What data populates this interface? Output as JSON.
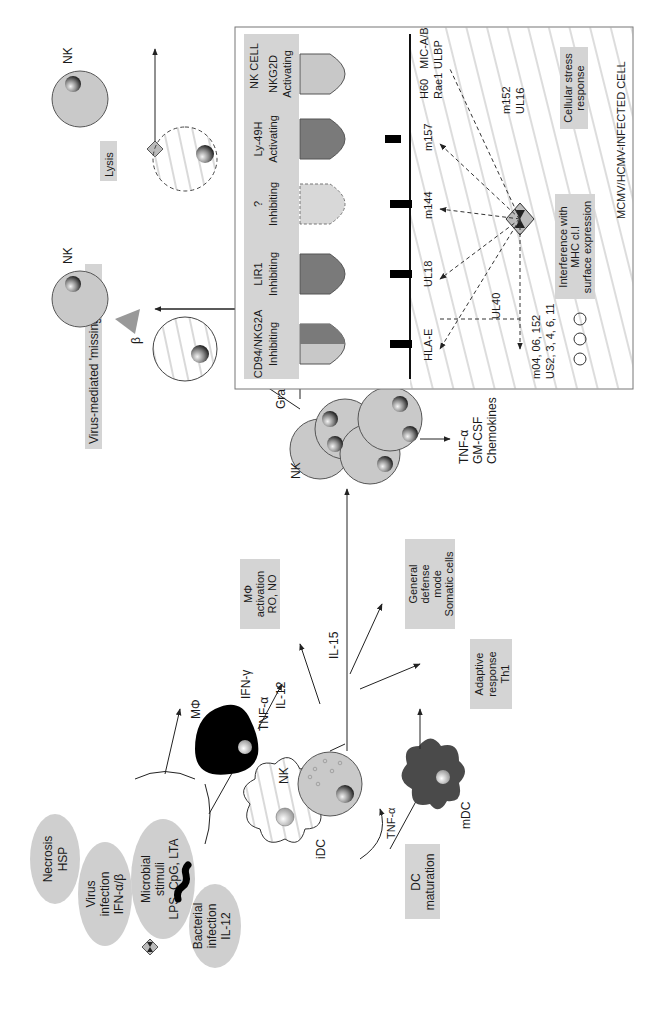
{
  "stimuli": {
    "necrosis": [
      "Necrosis",
      "HSP"
    ],
    "virus": [
      "Virus",
      "infection",
      "IFN-α/β"
    ],
    "microbial": [
      "Microbial",
      "stimuli",
      "LPS, CpG, LTA"
    ],
    "bacterial": [
      "Bacterial",
      "infection",
      "IL-12"
    ]
  },
  "cells": {
    "macrophage": "MΦ",
    "nk_main": "NK",
    "idc": "iDC",
    "mdc": "mDC",
    "nk_cluster": "NK",
    "nk_top1": "NK",
    "nk_top2": "NK"
  },
  "cytokines": {
    "tnf_a_1": "TNF-α",
    "il12": "IL-12",
    "ifn_g": "IFN-γ",
    "il15": "IL-15",
    "tnf_a_2": "TNF-α",
    "granulysin": "Granulysin",
    "secreted": [
      "TNF-α",
      "GM-CSF",
      "Chemokines"
    ]
  },
  "outcome_boxes": {
    "mphi_activation": [
      "MΦ",
      "activation",
      "RO, NO"
    ],
    "general_defense": [
      "General",
      "defense",
      "mode",
      "Somatic cells"
    ],
    "adaptive": [
      "Adaptive",
      "response",
      "Th1"
    ],
    "dc_maturation": [
      "DC",
      "maturation"
    ],
    "missing_self": "Virus-mediated 'missing self'",
    "lysis": "Lysis"
  },
  "receptor_panel": {
    "nk_cell_label": "NK CELL",
    "infected_cell_label": "MCMV/HCMV-INFECTED CELL",
    "receptors": [
      {
        "name": "CD94/NKG2A",
        "type": "Inhibiting",
        "ligand": "HLA-E"
      },
      {
        "name": "LIR1",
        "type": "Inhibiting",
        "ligand": "UL18"
      },
      {
        "name": "?",
        "type": "Inhibiting",
        "ligand": "m144"
      },
      {
        "name": "Ly-49H",
        "type": "Activating",
        "ligand": "m157"
      },
      {
        "name": "NKG2D",
        "type": "Activating",
        "ligand": [
          "H60",
          "Rae1",
          "MIC-A/B",
          "ULBP"
        ]
      }
    ],
    "ul40": "UL40",
    "m152_ul16": [
      "m152",
      "UL16"
    ],
    "mhc_genes": [
      "m04, 06, 152",
      "US2, 3, 4, 6, 11"
    ],
    "interference_box": [
      "Interference with",
      "MHC cl.I",
      "surface expression"
    ],
    "stress_box": [
      "Cellular stress",
      "response"
    ]
  },
  "colors": {
    "box_fill": "#d4d4d4",
    "cell_fill": "#c9c9c9",
    "receptor_dark": "#7a7a7a",
    "receptor_light": "#c8c8c8",
    "macrophage": "#000000",
    "mdc": "#4a4a4a"
  }
}
